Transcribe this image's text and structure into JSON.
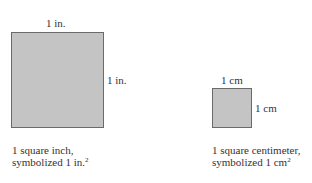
{
  "inch": {
    "top_label": "1 in.",
    "side_label": "1 in.",
    "caption_line1": "1 square inch,",
    "caption_line2": "symbolized 1 in.",
    "caption_sup": "2"
  },
  "cm": {
    "top_label": "1 cm",
    "side_label": "1 cm",
    "caption_line1": "1 square centimeter,",
    "caption_line2": "symbolized 1 cm",
    "caption_sup": "2"
  },
  "colors": {
    "fill": "#c4c4c4",
    "border": "#6a6a6a",
    "text": "#333333"
  }
}
